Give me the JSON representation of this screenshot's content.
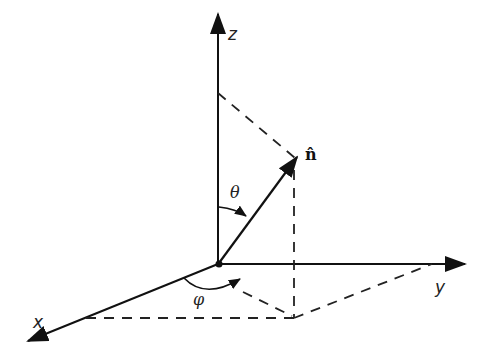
{
  "diagram": {
    "labels": {
      "z_axis": "z",
      "y_axis": "y",
      "x_axis": "x",
      "vector": "n̂",
      "polar_angle": "θ",
      "azimuth_angle": "φ"
    },
    "colors": {
      "stroke": "#111111",
      "dash": "#222222"
    }
  }
}
